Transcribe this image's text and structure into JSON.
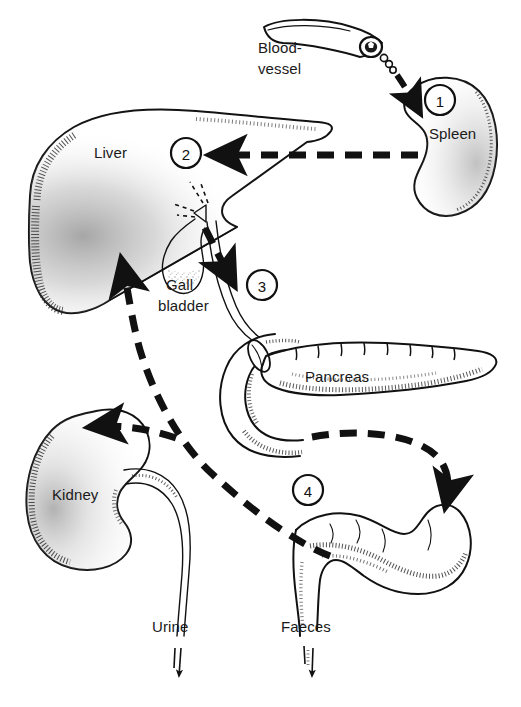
{
  "diagram": {
    "width": 521,
    "height": 707,
    "background_color": "#ffffff",
    "ink_color": "#111111",
    "style": "black-and-white stippled line drawing"
  },
  "labels": {
    "blood_vessel_line1": "Blood-",
    "blood_vessel_line2": "vessel",
    "spleen": "Spleen",
    "liver": "Liver",
    "gall_line1": "Gall",
    "gall_line2": "bladder",
    "pancreas": "Pancreas",
    "kidney": "Kidney",
    "urine": "Urine",
    "faeces": "Faeces"
  },
  "steps": [
    {
      "number": "1",
      "cx": 440,
      "cy": 100,
      "r": 15,
      "near": "Spleen"
    },
    {
      "number": "2",
      "cx": 186,
      "cy": 153,
      "r": 15,
      "near": "Liver"
    },
    {
      "number": "3",
      "cx": 262,
      "cy": 285,
      "r": 15,
      "near": "Bile duct"
    },
    {
      "number": "4",
      "cx": 308,
      "cy": 490,
      "r": 15,
      "near": "Intestine"
    }
  ],
  "organs": [
    {
      "name": "blood-vessel",
      "label": "Blood-vessel"
    },
    {
      "name": "spleen",
      "label": "Spleen"
    },
    {
      "name": "liver",
      "label": "Liver"
    },
    {
      "name": "gall-bladder",
      "label": "Gall bladder"
    },
    {
      "name": "pancreas",
      "label": "Pancreas"
    },
    {
      "name": "duodenum",
      "label": "Duodenum"
    },
    {
      "name": "kidney",
      "label": "Kidney"
    },
    {
      "name": "intestine",
      "label": "Intestine"
    }
  ],
  "flow_arrows": [
    {
      "from": "Blood-vessel",
      "to": "Spleen",
      "style": "dashed-curve",
      "step": "1"
    },
    {
      "from": "Spleen",
      "to": "Liver",
      "style": "dashed-horizontal",
      "step": "2"
    },
    {
      "from": "Liver",
      "to": "Bile duct / duodenum",
      "style": "dashed-curve",
      "step": "3"
    },
    {
      "from": "Duodenum",
      "to": "Intestine",
      "style": "dashed-curve",
      "step": "4"
    },
    {
      "from": "Intestine",
      "to": "Liver",
      "style": "dashed-long-curve",
      "step": ""
    },
    {
      "from": "Intestine",
      "to": "Kidney",
      "style": "dashed-branch",
      "step": ""
    },
    {
      "from": "Kidney",
      "to": "Urine",
      "style": "solid-tube-arrow",
      "step": ""
    },
    {
      "from": "Intestine",
      "to": "Faeces",
      "style": "solid-tube-arrow",
      "step": ""
    }
  ]
}
